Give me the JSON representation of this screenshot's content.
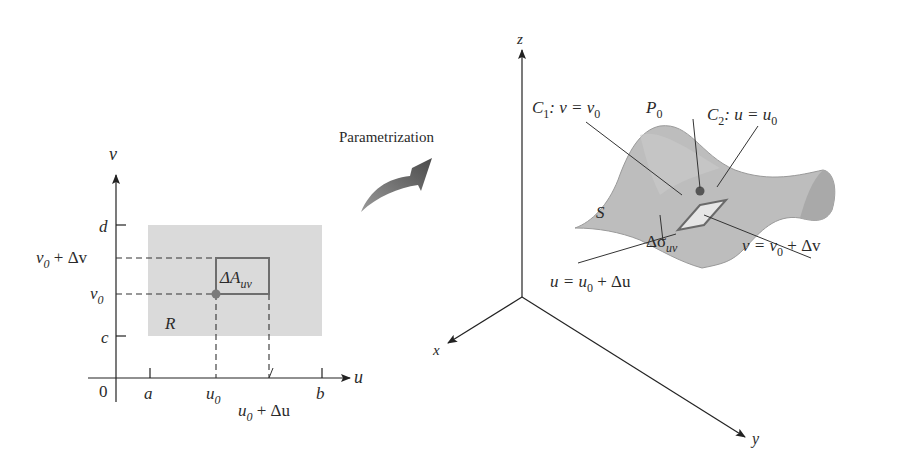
{
  "arrow_label": "Parametrization",
  "left_diagram": {
    "axes": {
      "horizontal": "u",
      "vertical": "v",
      "origin": "0"
    },
    "x_ticks": [
      "a",
      "u",
      "b"
    ],
    "x_tick_u0_sub": "0",
    "x_label_u0_du": {
      "base": "u",
      "sub": "0",
      "rest": " + Δu"
    },
    "y_ticks": [
      "d",
      "c"
    ],
    "y_label_v0": {
      "base": "v",
      "sub": "0"
    },
    "y_label_v0_dv": {
      "base": "v",
      "sub": "0",
      "rest": " + Δv"
    },
    "region_label": "R",
    "cell_label": {
      "base": "ΔA",
      "sub": "uv"
    },
    "colors": {
      "region": "#d9d9d9",
      "cell_border": "#6e6e6e",
      "point": "#7a7a7a"
    }
  },
  "right_diagram": {
    "axes": {
      "x": "x",
      "y": "y",
      "z": "z"
    },
    "surface_label": "S",
    "point_label": {
      "base": "P",
      "sub": "0"
    },
    "curve1": {
      "base": "C",
      "sub": "1",
      "rest": ": v = v",
      "sub2": "0"
    },
    "curve2": {
      "base": "C",
      "sub": "2",
      "rest": ": u = u",
      "sub2": "0"
    },
    "label_v_dv": {
      "pre": "v = v",
      "sub": "0",
      "rest": " + Δv"
    },
    "label_u_du": {
      "pre": "u = u",
      "sub": "0",
      "rest": " + Δu"
    },
    "patch_label": {
      "base": "Δσ",
      "sub": "uv"
    },
    "colors": {
      "surface": "#bdbdbd",
      "surface_dark": "#a8a8a8",
      "patch": "#e6e6e6",
      "point": "#555555"
    }
  }
}
